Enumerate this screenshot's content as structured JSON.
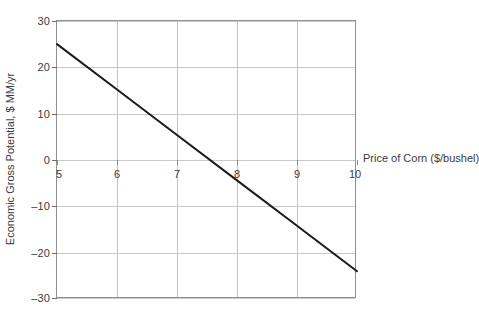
{
  "chart_data": {
    "type": "line",
    "title": "",
    "subtitle": "",
    "xlabel": "Price of Corn ($/bushel)",
    "ylabel": "Economic Gross Potential, $ MM/yr",
    "xlim": [
      5,
      10
    ],
    "ylim": [
      -30,
      30
    ],
    "xticks": [
      5,
      6,
      7,
      8,
      9,
      10
    ],
    "xtick_labels": [
      "5",
      "6",
      "7",
      "8",
      "9",
      "10"
    ],
    "yticks": [
      30,
      20,
      10,
      0,
      -10,
      -20,
      -30
    ],
    "ytick_labels": [
      "30",
      "20",
      "10",
      "0",
      "–10",
      "–20",
      "–30"
    ],
    "grid": true,
    "grid_color": "#c9c9c9",
    "legend": false,
    "legend_position": "none",
    "xaxis_labels_at_zero": true,
    "series": [
      {
        "name": "Economic Gross Potential",
        "color": "#1a1a1a",
        "line_width": 2,
        "x": [
          5,
          6,
          7,
          8,
          9,
          10
        ],
        "values": [
          25.0,
          15.2,
          5.4,
          -4.4,
          -14.2,
          -24.0
        ],
        "x_intercept": 7.55,
        "slope": -9.8,
        "intercept": 74.0
      }
    ]
  },
  "axes": {
    "y_title": "Economic Gross Potential, $ MM/yr",
    "x_title": "Price of Corn ($/bushel)"
  }
}
